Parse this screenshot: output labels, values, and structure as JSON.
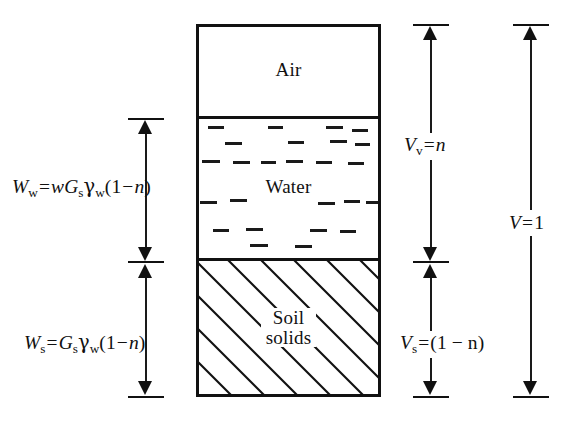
{
  "figure": {
    "type": "soil-phase-diagram"
  },
  "zones": [
    {
      "id": "air",
      "label": "Air",
      "label_lines": [
        "Air"
      ]
    },
    {
      "id": "water",
      "label": "Water",
      "label_lines": [
        "Water"
      ]
    },
    {
      "id": "soil",
      "label": "Soil solids",
      "label_lines": [
        "Soil",
        "solids"
      ]
    }
  ],
  "left_labels": {
    "water_weight": {
      "plain": "Ww = wGsγw(1 − n)",
      "symbol": "W",
      "symbol_sub": "w",
      "expr": [
        {
          "t": "w",
          "style": "italic"
        },
        {
          "t": "G",
          "style": "italic"
        },
        {
          "t": "s",
          "style": "sub"
        },
        {
          "t": "γ",
          "style": "gamma"
        },
        {
          "t": "w",
          "style": "sub"
        },
        {
          "t": "(1",
          "style": "upright"
        },
        {
          "t": "−",
          "style": "op"
        },
        {
          "t": "n",
          "style": "italic"
        },
        {
          "t": ")",
          "style": "upright"
        }
      ]
    },
    "soil_weight": {
      "plain": "Ws = Gsγw(1 − n)",
      "symbol": "W",
      "symbol_sub": "s",
      "expr": [
        {
          "t": "G",
          "style": "italic"
        },
        {
          "t": "s",
          "style": "sub"
        },
        {
          "t": "γ",
          "style": "gamma"
        },
        {
          "t": "w",
          "style": "sub"
        },
        {
          "t": "(1",
          "style": "upright"
        },
        {
          "t": "−",
          "style": "op"
        },
        {
          "t": "n",
          "style": "italic"
        },
        {
          "t": ")",
          "style": "upright"
        }
      ]
    }
  },
  "right_labels": {
    "void_volume": {
      "plain": "Vv = n",
      "symbol": "V",
      "symbol_sub": "v",
      "value": "n"
    },
    "solid_volume": {
      "plain": "Vs = (1 − n)",
      "symbol": "V",
      "symbol_sub": "s",
      "value": "(1 − n)"
    },
    "total_volume": {
      "plain": "V = 1",
      "symbol": "V",
      "symbol_sub": "",
      "value": "1"
    }
  },
  "symbols": {
    "equals": "=",
    "minus": "−",
    "gamma": "γ",
    "open_paren": "(",
    "close_paren": ")",
    "one": "1",
    "n": "n",
    "w_italic": "w",
    "G": "G"
  },
  "colors": {
    "stroke": "#111111",
    "background": "#ffffff",
    "dash": "#1a1a1a"
  }
}
